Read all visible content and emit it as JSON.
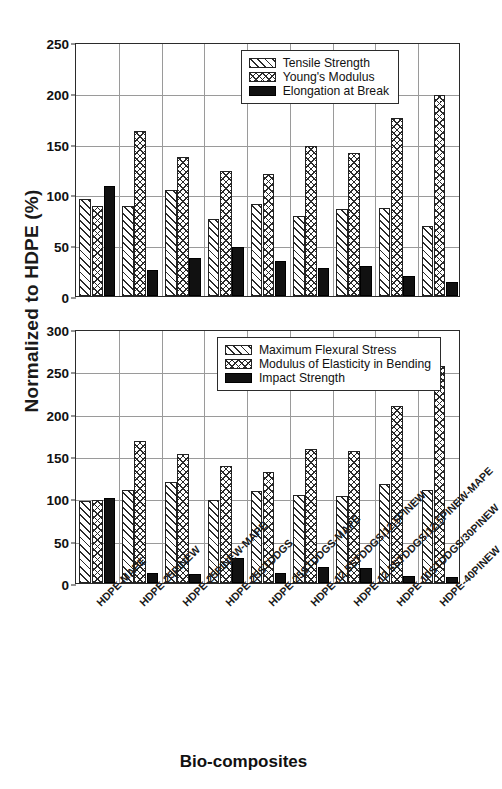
{
  "axis": {
    "ylabel": "Normalized to HDPE (%)",
    "xlabel": "Bio-composites"
  },
  "categories": [
    "HDPE-MAPE",
    "HDPE-25PINEW",
    "HDPE-25PINEW-MAPE",
    "HDPE-25STDDGS",
    "HDPE-25STDDGS-MAPE",
    "HDPE-12.5STDDGS/12.5PINEW",
    "HDPE-12.5STDDGS/12.5PINEW-MAPE",
    "HDPE-10STDDGS/30PINEW",
    "HDPE-40PINEW"
  ],
  "chart_data": [
    {
      "type": "bar",
      "panel": "top",
      "title": "",
      "xlabel": "Bio-composites",
      "ylabel": "Normalized to HDPE (%)",
      "ylim": [
        0,
        250
      ],
      "yticks": [
        0,
        50,
        100,
        150,
        200,
        250
      ],
      "grid": true,
      "legend_position": "top-right-inside",
      "categories": [
        "HDPE-MAPE",
        "HDPE-25PINEW",
        "HDPE-25PINEW-MAPE",
        "HDPE-25STDDGS",
        "HDPE-25STDDGS-MAPE",
        "HDPE-12.5STDDGS/12.5PINEW",
        "HDPE-12.5STDDGS/12.5PINEW-MAPE",
        "HDPE-10STDDGS/30PINEW",
        "HDPE-40PINEW"
      ],
      "series": [
        {
          "name": "Tensile Strength",
          "pattern": "diagonal-hatch",
          "values": [
            95,
            89,
            104,
            76,
            91,
            79,
            86,
            87,
            69
          ]
        },
        {
          "name": "Young's Modulus",
          "pattern": "cross-hatch",
          "values": [
            89,
            162,
            137,
            123,
            120,
            148,
            141,
            175,
            198
          ]
        },
        {
          "name": "Elongation at Break",
          "pattern": "solid-black",
          "values": [
            108,
            26,
            37,
            48,
            34,
            28,
            30,
            20,
            14
          ]
        }
      ]
    },
    {
      "type": "bar",
      "panel": "bottom",
      "title": "",
      "xlabel": "Bio-composites",
      "ylabel": "Normalized to HDPE (%)",
      "ylim": [
        0,
        300
      ],
      "yticks": [
        0,
        50,
        100,
        150,
        200,
        250,
        300
      ],
      "grid": true,
      "legend_position": "top-right-inside",
      "categories": [
        "HDPE-MAPE",
        "HDPE-25PINEW",
        "HDPE-25PINEW-MAPE",
        "HDPE-25STDDGS",
        "HDPE-25STDDGS-MAPE",
        "HDPE-12.5STDDGS/12.5PINEW",
        "HDPE-12.5STDDGS/12.5PINEW-MAPE",
        "HDPE-10STDDGS/30PINEW",
        "HDPE-40PINEW"
      ],
      "series": [
        {
          "name": "Maximum Flexural Stress",
          "pattern": "diagonal-hatch",
          "values": [
            97,
            110,
            119,
            98,
            109,
            104,
            103,
            117,
            110
          ]
        },
        {
          "name": "Modulus of Elasticity in Bending",
          "pattern": "cross-hatch",
          "values": [
            98,
            168,
            152,
            138,
            131,
            158,
            156,
            209,
            256
          ]
        },
        {
          "name": "Impact Strength",
          "pattern": "solid-black",
          "values": [
            100,
            12,
            11,
            30,
            12,
            19,
            18,
            8,
            7
          ]
        }
      ]
    }
  ]
}
